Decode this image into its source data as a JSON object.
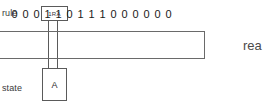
{
  "diagram": {
    "kind": "turing-machine",
    "rule": {
      "label": "rule",
      "value": "1RA"
    },
    "state": {
      "label": "state",
      "value": "A"
    },
    "tape": {
      "cells": [
        "0",
        "0",
        "0",
        "1",
        "1",
        "0",
        "1",
        "1",
        "1",
        "0",
        "0",
        "0",
        "0",
        "0",
        "0"
      ],
      "head_index": 4,
      "head_value": "1"
    },
    "read_label": "rea",
    "colors": {
      "background": "#ffffff",
      "stroke": "#5a5a5a",
      "tape_stroke": "#6a6a6a",
      "text": "#1a1a1a",
      "label_text": "#3a3a3a"
    }
  }
}
